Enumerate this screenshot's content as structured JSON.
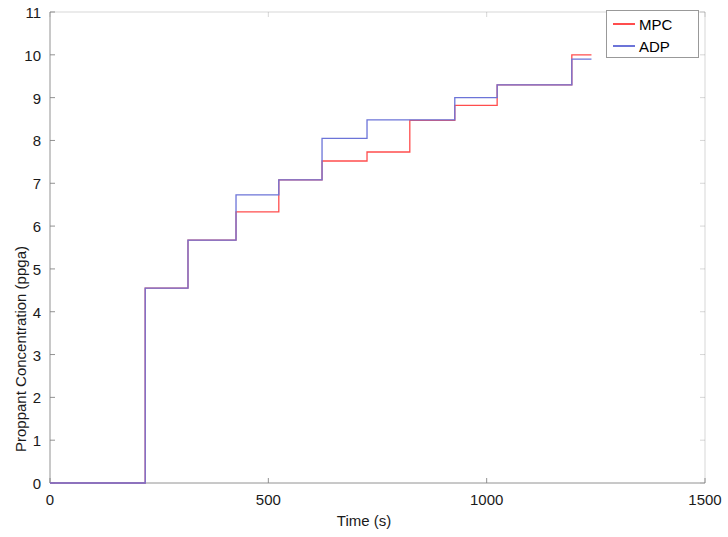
{
  "chart_data": {
    "type": "line",
    "subtype": "step",
    "title": "",
    "xlabel": "Time (s)",
    "ylabel": "Proppant Concentration (ppga)",
    "xlim": [
      0,
      1500
    ],
    "ylim": [
      0,
      11
    ],
    "xticks": [
      0,
      500,
      1000,
      1500
    ],
    "yticks": [
      0,
      1,
      2,
      3,
      4,
      5,
      6,
      7,
      8,
      9,
      10,
      11
    ],
    "grid": false,
    "legend_position": "top-right",
    "series": [
      {
        "name": "MPC",
        "color": "#ff4d4d",
        "x": [
          0,
          218,
          218,
          316,
          316,
          426,
          426,
          524,
          524,
          623,
          623,
          726,
          726,
          824,
          824,
          927,
          927,
          1024,
          1024,
          1122,
          1122,
          1195,
          1195,
          1240
        ],
        "y": [
          0,
          0,
          4.55,
          4.55,
          5.67,
          5.67,
          6.33,
          6.33,
          7.08,
          7.08,
          7.52,
          7.52,
          7.73,
          7.73,
          8.47,
          8.47,
          8.82,
          8.82,
          9.3,
          9.3,
          9.3,
          9.3,
          10.0,
          10.0
        ]
      },
      {
        "name": "ADP",
        "color": "#6c74d8",
        "x": [
          0,
          218,
          218,
          316,
          316,
          426,
          426,
          524,
          524,
          623,
          623,
          726,
          726,
          824,
          824,
          927,
          927,
          1024,
          1024,
          1122,
          1122,
          1195,
          1195,
          1240
        ],
        "y": [
          0,
          0,
          4.55,
          4.55,
          5.67,
          5.67,
          6.73,
          6.73,
          7.08,
          7.08,
          8.05,
          8.05,
          8.48,
          8.48,
          8.48,
          8.48,
          9.0,
          9.0,
          9.3,
          9.3,
          9.3,
          9.3,
          9.9,
          9.9
        ]
      }
    ]
  },
  "legend": {
    "entries": [
      {
        "label": "MPC",
        "color": "#ff4d4d"
      },
      {
        "label": "ADP",
        "color": "#6c74d8"
      }
    ]
  },
  "axes": {
    "x_tick_labels": [
      "0",
      "500",
      "1000",
      "1500"
    ],
    "y_tick_labels": [
      "0",
      "1",
      "2",
      "3",
      "4",
      "5",
      "6",
      "7",
      "8",
      "9",
      "10",
      "11"
    ],
    "x_axis_title": "Time (s)",
    "y_axis_title": "Proppant Concentration (ppga)"
  },
  "colors": {
    "mpc": "#ff4d4d",
    "adp": "#6c74d8",
    "axis": "#808080",
    "text": "#1a1a1a",
    "background": "#ffffff"
  }
}
